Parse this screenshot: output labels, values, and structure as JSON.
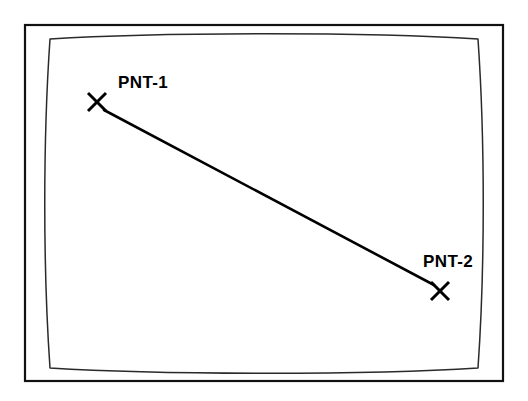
{
  "diagram": {
    "background_color": "#ffffff",
    "line_color": "#000000",
    "frame_color": "#111111",
    "inner_frame_color": "#2a2a2a",
    "outer_frame": {
      "x": 25,
      "y": 25,
      "width": 478,
      "height": 356
    },
    "inner_frame": {
      "description": "barrel-distorted CRT-style rounded frame",
      "path": "M 50 39 C 160 32 370 32 478 39 C 485 140 485 268 478 368 C 370 375 160 375 50 368 C 43 268 43 140 50 39 Z"
    },
    "points": [
      {
        "id": "pnt-1",
        "label": "PNT-1",
        "marker": "X",
        "marker_x": 97,
        "marker_y": 102,
        "marker_size": 9,
        "label_x": 118,
        "label_y": 88
      },
      {
        "id": "pnt-2",
        "label": "PNT-2",
        "marker": "X",
        "marker_x": 440,
        "marker_y": 291,
        "marker_size": 9,
        "label_x": 423,
        "label_y": 267
      }
    ],
    "connector": {
      "name": "pnt-1-to-pnt-2",
      "x1": 104,
      "y1": 110,
      "x2": 434,
      "y2": 285
    }
  }
}
